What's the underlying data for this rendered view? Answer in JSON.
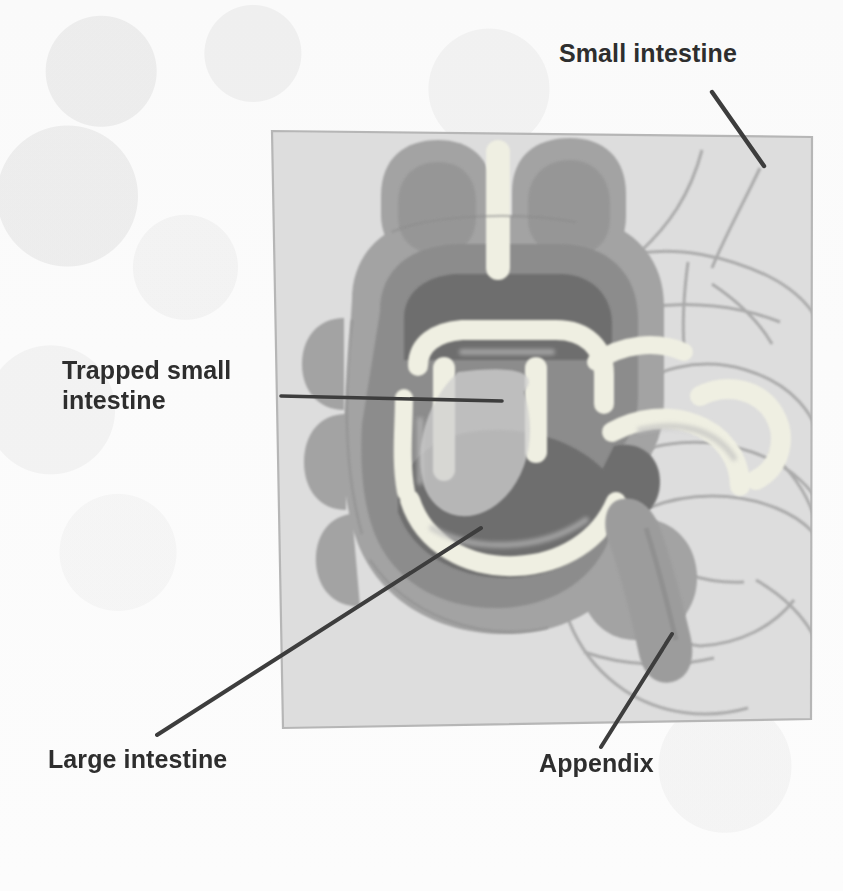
{
  "figure": {
    "kind": "anatomical-illustration",
    "palette": {
      "page_background": "#fbfbfb",
      "panel_fill": "#dcdcdc",
      "panel_border": "#b4b4b4",
      "small_intestine_outline": "#a9a9a9",
      "colon_wall": "#a0a0a0",
      "colon_wall_dark": "#8f8f8f",
      "colon_lumen_dark": "#6f6f6f",
      "trapped_intestine_light": "#efefe4",
      "appendix": "#9a9a9a",
      "leader_line": "#3c3c3c",
      "label_text": "#2e2e2e"
    }
  },
  "labels": [
    {
      "id": "small-intestine",
      "text": "Small intestine",
      "x": 559,
      "y": 38,
      "align": "left"
    },
    {
      "id": "trapped-small-intestine",
      "text": "Trapped small\nintestine",
      "x": 62,
      "y": 355,
      "align": "left"
    },
    {
      "id": "large-intestine",
      "text": "Large intestine",
      "x": 48,
      "y": 744,
      "align": "left"
    },
    {
      "id": "appendix",
      "text": "Appendix",
      "x": 539,
      "y": 748,
      "align": "left"
    }
  ],
  "leader_lines": [
    {
      "id": "small-intestine-leader",
      "x1": 712,
      "y1": 92,
      "x2": 764,
      "y2": 166
    },
    {
      "id": "trapped-small-intestine-leader",
      "x1": 281,
      "y1": 396,
      "x2": 502,
      "y2": 401
    },
    {
      "id": "large-intestine-leader",
      "x1": 157,
      "y1": 735,
      "x2": 481,
      "y2": 528
    },
    {
      "id": "appendix-leader",
      "x1": 601,
      "y1": 747,
      "x2": 672,
      "y2": 634
    }
  ],
  "panel": {
    "id": "illustration-panel",
    "description": "Light gray skewed rectangular backdrop panel holding the drawing",
    "points": "272,131 812,137 811,719 283,728"
  }
}
